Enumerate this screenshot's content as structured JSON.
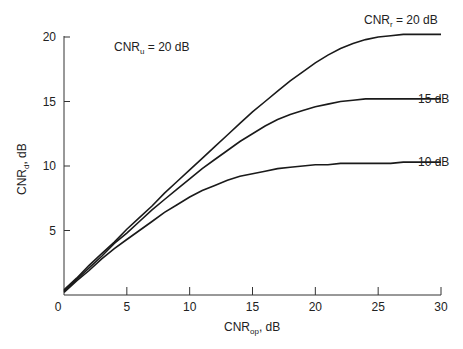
{
  "chart_data": {
    "type": "line",
    "title": "",
    "xlabel": "CNR_op, dB",
    "ylabel": "CNR_d, dB",
    "xlim": [
      0,
      30
    ],
    "ylim": [
      0,
      20
    ],
    "x_ticks": [
      0,
      5,
      10,
      15,
      20,
      25,
      30
    ],
    "y_ticks": [
      0,
      5,
      10,
      15,
      20
    ],
    "grid": false,
    "x": [
      0,
      1,
      2,
      3,
      4,
      5,
      6,
      7,
      8,
      9,
      10,
      11,
      12,
      13,
      14,
      15,
      16,
      17,
      18,
      19,
      20,
      21,
      22,
      23,
      24,
      25,
      26,
      27,
      28,
      29,
      30
    ],
    "series": [
      {
        "name": "CNR_r = 20 dB",
        "values": [
          0.4,
          1.3,
          2.3,
          3.2,
          4.1,
          5.1,
          6.0,
          6.9,
          7.9,
          8.8,
          9.7,
          10.6,
          11.5,
          12.4,
          13.3,
          14.2,
          15.0,
          15.8,
          16.6,
          17.3,
          18.0,
          18.6,
          19.1,
          19.5,
          19.8,
          20.0,
          20.1,
          20.2,
          20.2,
          20.2,
          20.2
        ]
      },
      {
        "name": "15 dB",
        "values": [
          0.3,
          1.2,
          2.1,
          3.0,
          4.0,
          4.8,
          5.7,
          6.6,
          7.4,
          8.2,
          9.0,
          9.8,
          10.5,
          11.2,
          11.9,
          12.5,
          13.1,
          13.6,
          14.0,
          14.3,
          14.6,
          14.8,
          15.0,
          15.1,
          15.2,
          15.2,
          15.2,
          15.2,
          15.2,
          15.2,
          15.2
        ]
      },
      {
        "name": "10 dB",
        "values": [
          0.2,
          1.1,
          1.9,
          2.8,
          3.6,
          4.3,
          5.0,
          5.7,
          6.4,
          7.0,
          7.6,
          8.1,
          8.5,
          8.9,
          9.2,
          9.4,
          9.6,
          9.8,
          9.9,
          10.0,
          10.1,
          10.1,
          10.2,
          10.2,
          10.2,
          10.2,
          10.2,
          10.3,
          10.3,
          10.3,
          10.3
        ]
      }
    ],
    "annotations": [
      {
        "text": "CNR_u = 20 dB"
      },
      {
        "text": "CNR_r = 20 dB"
      },
      {
        "text": "15 dB"
      },
      {
        "text": "10 dB"
      }
    ]
  },
  "labels": {
    "x_axis_main": "CNR",
    "x_axis_sub": "op",
    "x_axis_unit": ", dB",
    "y_axis_main": "CNR",
    "y_axis_sub": "d",
    "y_axis_unit": ", dB",
    "uplink_main": "CNR",
    "uplink_sub": "u",
    "uplink_rest": " = 20 dB",
    "curve20_main": "CNR",
    "curve20_sub": "r",
    "curve20_rest": " = 20 dB",
    "curve15": "15 dB",
    "curve10": "10 dB"
  }
}
